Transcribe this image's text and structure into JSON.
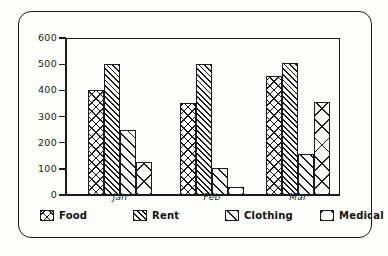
{
  "figure": {
    "title": "",
    "y_axis_ticks": [
      "600",
      "500",
      "400",
      "300",
      "200",
      "100",
      "0"
    ],
    "x_axis_ticks": [
      "Jan",
      "Feb",
      "Mar"
    ]
  },
  "legend": {
    "position": "below-axis",
    "items": [
      {
        "label": "Food",
        "pattern": "cross-hatch-fine",
        "key": "food"
      },
      {
        "label": "Rent",
        "pattern": "diagonal-dense",
        "key": "rent"
      },
      {
        "label": "Clothing",
        "pattern": "diagonal-sparse",
        "key": "clothing"
      },
      {
        "label": "Medical",
        "pattern": "cross-hatch-coarse",
        "key": "medical"
      }
    ]
  },
  "chart_data": {
    "type": "bar",
    "title": "",
    "xlabel": "",
    "ylabel": "",
    "categories": [
      "Jan",
      "Feb",
      "Mar"
    ],
    "ylim": [
      0,
      600
    ],
    "yticks": [
      0,
      100,
      200,
      300,
      400,
      500,
      600
    ],
    "grid": false,
    "legend_position": "bottom",
    "series": [
      {
        "name": "Food",
        "values": [
          400,
          350,
          455
        ]
      },
      {
        "name": "Rent",
        "values": [
          500,
          500,
          505
        ]
      },
      {
        "name": "Clothing",
        "values": [
          250,
          105,
          155
        ]
      },
      {
        "name": "Medical",
        "values": [
          125,
          30,
          355
        ]
      }
    ]
  }
}
